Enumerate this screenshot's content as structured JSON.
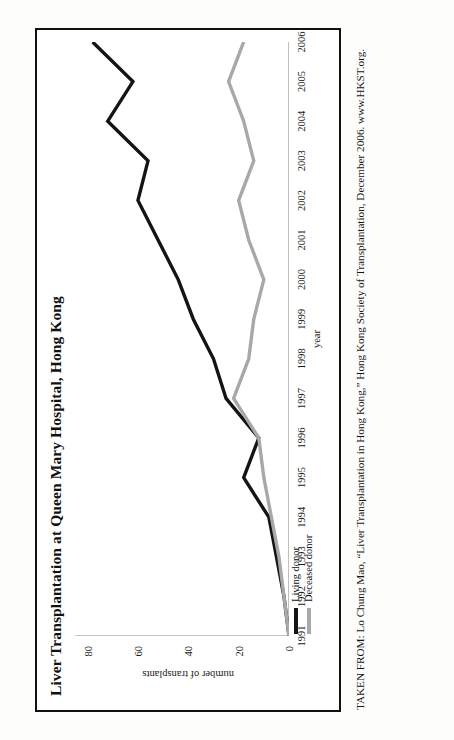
{
  "figure": {
    "title": "Liver Transplantation at Queen Mary Hospital, Hong Kong",
    "caption": "TAKEN FROM: Lo Chung Mao, “Liver Transplantation in Hong Kong,” Hong Kong Society of Transplantation, December 2006. www.HKST.org."
  },
  "legend": {
    "items": [
      {
        "label": "Living donor",
        "color": "#141414"
      },
      {
        "label": "Deceased donor",
        "color": "#a8a8a8"
      }
    ]
  },
  "chart_data": {
    "type": "line",
    "title": "Liver Transplantation at Queen Mary Hospital, Hong Kong",
    "xlabel": "year",
    "ylabel": "number of transplants",
    "categories": [
      "1991",
      "1992",
      "1993",
      "1994",
      "1995",
      "1996",
      "1997",
      "1998",
      "1999",
      "2000",
      "2001",
      "2002",
      "2003",
      "2004",
      "2005",
      "2006"
    ],
    "x": [
      1991,
      1992,
      1993,
      1994,
      1995,
      1996,
      1997,
      1998,
      1999,
      2000,
      2001,
      2002,
      2003,
      2004,
      2005,
      2006
    ],
    "series": [
      {
        "name": "Living donor",
        "color": "#141414",
        "values": [
          0,
          2,
          5,
          8,
          18,
          12,
          25,
          30,
          38,
          44,
          52,
          60,
          56,
          72,
          62,
          78
        ]
      },
      {
        "name": "Deceased donor",
        "color": "#a8a8a8",
        "values": [
          0,
          2,
          4,
          7,
          10,
          12,
          22,
          16,
          14,
          10,
          16,
          20,
          14,
          18,
          24,
          18
        ]
      }
    ],
    "yticks": [
      0,
      20,
      40,
      60,
      80
    ],
    "ytick_labels": [
      "0",
      "20",
      "40",
      "60",
      "80"
    ],
    "ylim": [
      0,
      85
    ],
    "xlim": [
      1991,
      2006
    ],
    "grid": false,
    "legend_position": "below-left"
  }
}
